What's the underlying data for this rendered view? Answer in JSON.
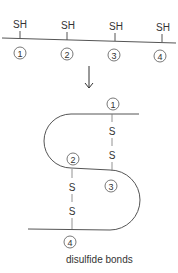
{
  "top": {
    "groups": [
      {
        "label": "SH",
        "number": "1"
      },
      {
        "label": "SH",
        "number": "2"
      },
      {
        "label": "SH",
        "number": "3"
      },
      {
        "label": "SH",
        "number": "4"
      }
    ]
  },
  "bottom": {
    "numbers": [
      "1",
      "2",
      "3",
      "4"
    ],
    "bond_atoms": [
      "S",
      "S",
      "S",
      "S"
    ],
    "caption": "disulfide bonds"
  },
  "colors": {
    "line": "#555555",
    "text": "#333333"
  }
}
